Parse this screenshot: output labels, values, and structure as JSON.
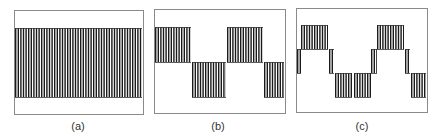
{
  "figure": {
    "panels": [
      {
        "label": "(a)",
        "box": {
          "x": 14,
          "y": 10,
          "w": 129,
          "h": 104
        },
        "label_x": 78,
        "segments": [
          {
            "x0": 15,
            "x1": 142,
            "y0": 28,
            "y1": 97
          }
        ]
      },
      {
        "label": "(b)",
        "box": {
          "x": 154,
          "y": 9,
          "w": 131,
          "h": 104
        },
        "label_x": 218,
        "segments": [
          {
            "x0": 155,
            "x1": 191,
            "y0": 27,
            "y1": 62
          },
          {
            "x0": 192,
            "x1": 226,
            "y0": 62,
            "y1": 97
          },
          {
            "x0": 227,
            "x1": 263,
            "y0": 27,
            "y1": 62
          },
          {
            "x0": 264,
            "x1": 284,
            "y0": 62,
            "y1": 97
          }
        ]
      },
      {
        "label": "(c)",
        "box": {
          "x": 296,
          "y": 8,
          "w": 131,
          "h": 104
        },
        "label_x": 362,
        "segments": [
          {
            "x0": 297,
            "x1": 301,
            "y0": 49,
            "y1": 73
          },
          {
            "x0": 301,
            "x1": 328,
            "y0": 25,
            "y1": 49
          },
          {
            "x0": 329,
            "x1": 334,
            "y0": 49,
            "y1": 73
          },
          {
            "x0": 335,
            "x1": 352,
            "y0": 73,
            "y1": 97
          },
          {
            "x0": 354,
            "x1": 371,
            "y0": 73,
            "y1": 97
          },
          {
            "x0": 371,
            "x1": 377,
            "y0": 49,
            "y1": 73
          },
          {
            "x0": 377,
            "x1": 404,
            "y0": 25,
            "y1": 49
          },
          {
            "x0": 405,
            "x1": 410,
            "y0": 49,
            "y1": 73
          },
          {
            "x0": 411,
            "x1": 426,
            "y0": 73,
            "y1": 97
          }
        ]
      }
    ],
    "stripe_pitch": 2.6,
    "stripe_width": 1.4,
    "colors": {
      "stripe": "#1a1a1a",
      "box": "#8a8a8a",
      "level_line": "#333333"
    }
  }
}
